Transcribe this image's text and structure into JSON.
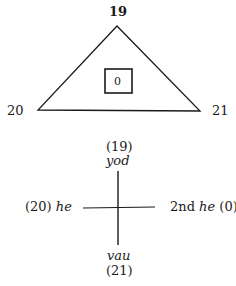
{
  "triangle": {
    "top_label": "19",
    "left_label": "20",
    "right_label": "21",
    "center_label": "0"
  },
  "cross": {
    "top_number": "(19)",
    "top_word": "yod",
    "left_number": "(20)",
    "left_word": "he",
    "right_prefix": "2nd",
    "right_word": "he",
    "right_number": "(0)",
    "bottom_word": "vau",
    "bottom_number": "(21)"
  },
  "colors": {
    "ink": "#1a1a1a",
    "background": "#ffffff"
  }
}
